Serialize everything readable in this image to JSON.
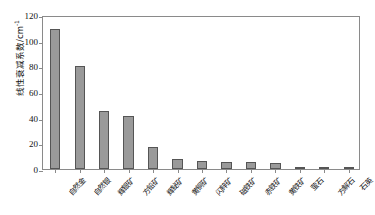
{
  "chart_data": {
    "type": "bar",
    "title": "",
    "xlabel": "",
    "ylabel": "线性衰减系数/cm",
    "ylabel_sup": "-1",
    "ylim": [
      0,
      120
    ],
    "yticks": [
      0,
      20,
      40,
      60,
      80,
      100,
      120
    ],
    "grid": false,
    "legend": "none",
    "bar_color": "#9a9a9a",
    "bar_edge_color": "#555555",
    "axis_color": "#8a8a8a",
    "categories": [
      "自然金",
      "自然银",
      "辉银矿",
      "方铅矿",
      "辉铋矿",
      "黄铜矿",
      "闪锌矿",
      "磁铁矿",
      "赤铁矿",
      "黄铁矿",
      "萤石",
      "方解石",
      "石英"
    ],
    "values": [
      109,
      80,
      45.5,
      41,
      17.5,
      8,
      6,
      5.5,
      5.5,
      5,
      1.8,
      1.5,
      1.2
    ]
  }
}
